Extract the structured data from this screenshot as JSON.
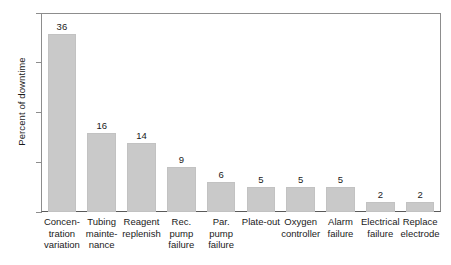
{
  "chart_data": {
    "type": "bar",
    "title": "",
    "xlabel": "",
    "ylabel": "Percent of downtime",
    "ylim": [
      0,
      40
    ],
    "yticks": [
      0,
      10,
      20,
      30,
      40
    ],
    "ytick_labels": [
      "0",
      "10",
      "20",
      "30",
      "40"
    ],
    "grid": false,
    "legend": null,
    "bar_color": "#c9c9c9",
    "axis_color": "#8d8d8d",
    "categories": [
      "Concentration variation",
      "Tubing maintenance",
      "Reagent replenish",
      "Rec. pump failure",
      "Par. pump failure",
      "Plate-out",
      "Oxygen controller",
      "Alarm failure",
      "Electrical failure",
      "Replace electrode"
    ],
    "category_lines": [
      [
        "Concen-",
        "tration",
        "variation"
      ],
      [
        "Tubing",
        "mainte-",
        "nance"
      ],
      [
        "Reagent",
        "replenish"
      ],
      [
        "Rec.",
        "pump",
        "failure"
      ],
      [
        "Par.",
        "pump",
        "failure"
      ],
      [
        "Plate-out"
      ],
      [
        "Oxygen",
        "controller"
      ],
      [
        "Alarm",
        "failure"
      ],
      [
        "Electrical",
        "failure"
      ],
      [
        "Replace",
        "electrode"
      ]
    ],
    "values": [
      36,
      16,
      14,
      9,
      6,
      5,
      5,
      5,
      2,
      2
    ],
    "value_labels": [
      "36",
      "16",
      "14",
      "9",
      "6",
      "5",
      "5",
      "5",
      "2",
      "2"
    ]
  }
}
